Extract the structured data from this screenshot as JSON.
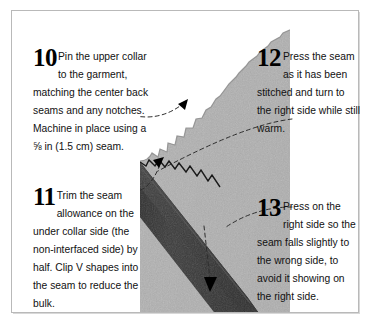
{
  "page": {
    "background_color": "#ffffff",
    "frame_color": "#b9b9b9"
  },
  "steps": [
    {
      "number": "10",
      "text": "Pin the upper collar to the garment, matching the center back seams and any notches. Machine in place using a ⅝ in (1.5 cm) seam."
    },
    {
      "number": "11",
      "text": "Trim the seam allowance on the under collar side (the non-interfaced side) by half. Clip V shapes into the seam to reduce the bulk."
    },
    {
      "number": "12",
      "text": "Press the seam as it has been stitched and turn to the right side while still warm."
    },
    {
      "number": "13",
      "text": "Press on the right side so the seam falls slightly to the wrong side, to avoid it showing on the right side."
    }
  ],
  "illustration": {
    "name": "collar-fabric-diagram",
    "upper_collar_color": "#a8a8a8",
    "under_collar_color": "#3a3a3a",
    "under_collar_shadow_color": "#262626",
    "leader_line_color": "#333333",
    "arrow_color": "#000000",
    "notched_edge_label": "clipped V notches",
    "arrows": [
      {
        "name": "notch-arrow-upper",
        "points_to": "clipped notch edge"
      },
      {
        "name": "notch-arrow-lower",
        "points_to": "trimmed under collar edge"
      },
      {
        "name": "press-direction-arrow",
        "points_to": "under collar fold direction"
      }
    ]
  }
}
